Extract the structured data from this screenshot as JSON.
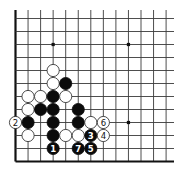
{
  "diagram": {
    "type": "go-board-fragment",
    "visible_edges": [
      "left",
      "bottom"
    ],
    "columns_visible": 13,
    "rows_visible": 13,
    "star_points": [
      {
        "col": 3,
        "row": 9
      },
      {
        "col": 9,
        "row": 9
      },
      {
        "col": 9,
        "row": 3
      }
    ],
    "stones": [
      {
        "color": "white",
        "col": 3,
        "row": 7,
        "label": ""
      },
      {
        "color": "white",
        "col": 3,
        "row": 6,
        "label": ""
      },
      {
        "color": "black",
        "col": 4,
        "row": 6,
        "label": ""
      },
      {
        "color": "white",
        "col": 1,
        "row": 5,
        "label": ""
      },
      {
        "color": "white",
        "col": 2,
        "row": 5,
        "label": ""
      },
      {
        "color": "black",
        "col": 3,
        "row": 5,
        "label": ""
      },
      {
        "color": "white",
        "col": 4,
        "row": 5,
        "label": ""
      },
      {
        "color": "white",
        "col": 1,
        "row": 4,
        "label": ""
      },
      {
        "color": "black",
        "col": 2,
        "row": 4,
        "label": ""
      },
      {
        "color": "black",
        "col": 3,
        "row": 4,
        "label": ""
      },
      {
        "color": "black",
        "col": 5,
        "row": 4,
        "label": ""
      },
      {
        "color": "white",
        "col": 0,
        "row": 3,
        "label": "2"
      },
      {
        "color": "black",
        "col": 1,
        "row": 3,
        "label": ""
      },
      {
        "color": "black",
        "col": 3,
        "row": 3,
        "label": ""
      },
      {
        "color": "black",
        "col": 5,
        "row": 3,
        "label": ""
      },
      {
        "color": "white",
        "col": 6,
        "row": 3,
        "label": ""
      },
      {
        "color": "white",
        "col": 7,
        "row": 3,
        "label": "6"
      },
      {
        "color": "white",
        "col": 1,
        "row": 2,
        "label": ""
      },
      {
        "color": "black",
        "col": 3,
        "row": 2,
        "label": ""
      },
      {
        "color": "white",
        "col": 4,
        "row": 2,
        "label": ""
      },
      {
        "color": "white",
        "col": 5,
        "row": 2,
        "label": ""
      },
      {
        "color": "black",
        "col": 6,
        "row": 2,
        "label": "3"
      },
      {
        "color": "white",
        "col": 7,
        "row": 2,
        "label": "4"
      },
      {
        "color": "black",
        "col": 3,
        "row": 1,
        "label": "1"
      },
      {
        "color": "black",
        "col": 5,
        "row": 1,
        "label": "7"
      },
      {
        "color": "black",
        "col": 6,
        "row": 1,
        "label": "5"
      }
    ],
    "move_sequence": [
      {
        "move": "1",
        "color": "black"
      },
      {
        "move": "2",
        "color": "white"
      },
      {
        "move": "3",
        "color": "black"
      },
      {
        "move": "4",
        "color": "white"
      },
      {
        "move": "5",
        "color": "black"
      },
      {
        "move": "6",
        "color": "white"
      },
      {
        "move": "7",
        "color": "black"
      }
    ],
    "colors": {
      "black_stone": "#0b0b0b",
      "white_stone": "#ffffff",
      "line": "#3a3a3a",
      "background": "#ffffff"
    }
  }
}
